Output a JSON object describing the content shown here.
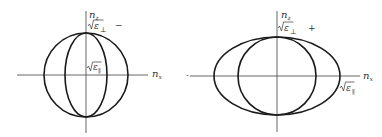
{
  "figure": {
    "left_panel": {
      "axis_vertical_label": "n",
      "axis_vertical_sub": "z",
      "axis_horizontal_label": "n",
      "axis_horizontal_sub": "x",
      "top_label_eps": "ε",
      "top_label_sub": "⊥",
      "inner_label_eps": "ε",
      "inner_label_sub": "∥",
      "sign": "−",
      "shapes": [
        {
          "kind": "circle",
          "description": "outer circle",
          "radius_px": 42
        },
        {
          "kind": "ellipse",
          "description": "inner prolate ellipse",
          "rx_px": 21,
          "ry_px": 42
        }
      ]
    },
    "right_panel": {
      "axis_vertical_label": "n",
      "axis_vertical_sub": "z",
      "axis_horizontal_label": "n",
      "axis_horizontal_sub": "x",
      "top_label_eps": "ε",
      "top_label_sub": "⊥",
      "side_label_eps": "ε",
      "side_label_sub": "∥",
      "sign": "+",
      "shapes": [
        {
          "kind": "ellipse",
          "description": "outer oblate ellipse",
          "rx_px": 63,
          "ry_px": 39
        },
        {
          "kind": "circle",
          "description": "inner circle",
          "radius_px": 39
        }
      ]
    }
  }
}
